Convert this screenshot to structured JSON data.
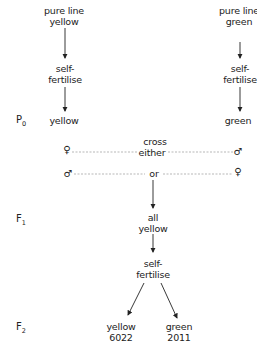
{
  "left_column": {
    "source": [
      "pure line",
      "yellow"
    ],
    "process": [
      "self-",
      "fertilise"
    ],
    "parent": "yellow"
  },
  "right_column": {
    "source": [
      "pure line",
      "green"
    ],
    "process": [
      "self-",
      "fertilise"
    ],
    "parent": "green"
  },
  "generations": {
    "p0": {
      "letter": "P",
      "sub": "0"
    },
    "f1": {
      "letter": "F",
      "sub": "1"
    },
    "f2": {
      "letter": "F",
      "sub": "2"
    }
  },
  "cross": {
    "label_top": "cross",
    "label_either": "either",
    "label_or": "or",
    "row1": {
      "left_symbol": "♀",
      "right_symbol": "♂"
    },
    "row2": {
      "left_symbol": "♂",
      "right_symbol": "♀"
    }
  },
  "f1_result": [
    "all",
    "yellow"
  ],
  "f1_process": [
    "self-",
    "fertilise"
  ],
  "f2_results": [
    {
      "phenotype": "yellow",
      "count": "6022"
    },
    {
      "phenotype": "green",
      "count": "2011"
    }
  ]
}
